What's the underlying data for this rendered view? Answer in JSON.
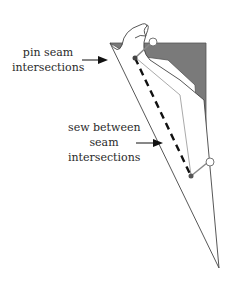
{
  "diagram": {
    "labels": {
      "pin": {
        "line1": "pin seam",
        "line2": "intersections"
      },
      "sew": {
        "line1": "sew between",
        "line2": "seam",
        "line3": "intersections"
      }
    },
    "colors": {
      "background": "#ffffff",
      "shaded_fabric": "#7a7a7a",
      "outline": "#444444",
      "seam_line": "#aaaaaa",
      "stitch_dashes": "#111111",
      "pin_head": "#ffffff",
      "pin_shaft": "#888888",
      "text": "#2a2a2a"
    }
  }
}
